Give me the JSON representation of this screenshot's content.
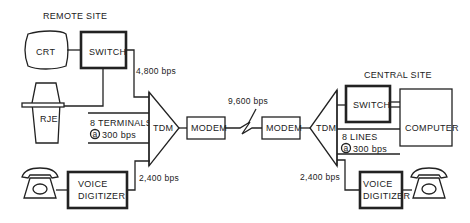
{
  "diagram": {
    "remote_site": {
      "title": "REMOTE SITE",
      "crt_label": "CRT",
      "switch_label": "SWITCH",
      "rje_label": "RJE",
      "terminals_line1": "8 TERMINALS",
      "terminals_at": "a",
      "terminals_line2": "300 bps",
      "tdm_label": "TDM",
      "modem_label": "MODEM",
      "voice_line1": "VOICE",
      "voice_line2": "DIGITIZER",
      "rate_switch": "4,800 bps",
      "rate_voice": "2,400 bps"
    },
    "link": {
      "rate": "9,600 bps"
    },
    "central_site": {
      "title": "CENTRAL SITE",
      "switch_label": "SWITCH",
      "computer_label": "COMPUTER",
      "lines_line1": "8 LINES",
      "lines_at": "a",
      "lines_line2": "300 bps",
      "tdm_label": "TDM",
      "modem_label": "MODEM",
      "voice_line1": "VOICE",
      "voice_line2": "DIGITIZER",
      "rate_voice": "2,400 bps"
    }
  }
}
